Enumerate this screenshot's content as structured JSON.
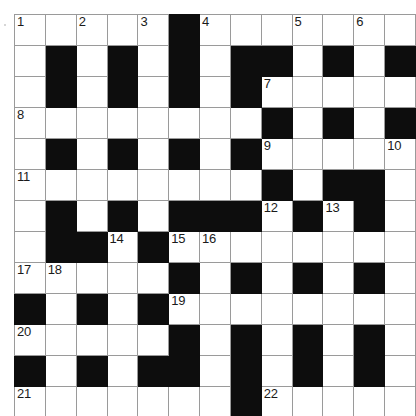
{
  "puzzle": {
    "type": "crossword-grid",
    "rows": 13,
    "columns": 13,
    "cell_size_px": 30,
    "colors": {
      "block": "#0d0d0d",
      "open": "#ffffff",
      "gridline": "#9a9a9a",
      "number_text": "#1a1a1a",
      "page_background": "#ffffff"
    },
    "grid": [
      [
        "O",
        "O",
        "O",
        "O",
        "O",
        "X",
        "O",
        "O",
        "O",
        "O",
        "O",
        "O",
        "O"
      ],
      [
        "O",
        "X",
        "O",
        "X",
        "O",
        "X",
        "O",
        "X",
        "X",
        "O",
        "X",
        "O",
        "X"
      ],
      [
        "O",
        "X",
        "O",
        "X",
        "O",
        "X",
        "O",
        "X",
        "O",
        "O",
        "O",
        "O",
        "O"
      ],
      [
        "O",
        "O",
        "O",
        "O",
        "O",
        "O",
        "O",
        "O",
        "X",
        "O",
        "X",
        "O",
        "X"
      ],
      [
        "O",
        "X",
        "O",
        "X",
        "O",
        "X",
        "O",
        "X",
        "O",
        "O",
        "O",
        "O",
        "O"
      ],
      [
        "O",
        "O",
        "O",
        "O",
        "O",
        "O",
        "O",
        "O",
        "X",
        "O",
        "X",
        "X",
        "O"
      ],
      [
        "O",
        "X",
        "O",
        "X",
        "O",
        "X",
        "X",
        "X",
        "O",
        "X",
        "O",
        "X",
        "O"
      ],
      [
        "O",
        "X",
        "X",
        "O",
        "X",
        "O",
        "O",
        "O",
        "O",
        "O",
        "O",
        "O",
        "O"
      ],
      [
        "O",
        "O",
        "O",
        "O",
        "O",
        "X",
        "O",
        "X",
        "O",
        "X",
        "O",
        "X",
        "O"
      ],
      [
        "X",
        "O",
        "X",
        "O",
        "X",
        "O",
        "O",
        "O",
        "O",
        "O",
        "O",
        "O",
        "O"
      ],
      [
        "O",
        "O",
        "O",
        "O",
        "O",
        "X",
        "O",
        "X",
        "O",
        "X",
        "O",
        "X",
        "O"
      ],
      [
        "X",
        "O",
        "X",
        "O",
        "X",
        "X",
        "O",
        "X",
        "O",
        "X",
        "O",
        "X",
        "O"
      ],
      [
        "O",
        "O",
        "O",
        "O",
        "O",
        "O",
        "O",
        "X",
        "O",
        "O",
        "O",
        "O",
        "O"
      ]
    ],
    "numbers": [
      {
        "number": "1",
        "row": 1,
        "col": 1
      },
      {
        "number": "2",
        "row": 1,
        "col": 3
      },
      {
        "number": "3",
        "row": 1,
        "col": 5
      },
      {
        "number": "4",
        "row": 1,
        "col": 7
      },
      {
        "number": "5",
        "row": 1,
        "col": 10
      },
      {
        "number": "6",
        "row": 1,
        "col": 12
      },
      {
        "number": "7",
        "row": 3,
        "col": 9
      },
      {
        "number": "8",
        "row": 4,
        "col": 1
      },
      {
        "number": "9",
        "row": 5,
        "col": 9
      },
      {
        "number": "10",
        "row": 5,
        "col": 13
      },
      {
        "number": "11",
        "row": 6,
        "col": 1
      },
      {
        "number": "12",
        "row": 7,
        "col": 9
      },
      {
        "number": "13",
        "row": 7,
        "col": 11
      },
      {
        "number": "14",
        "row": 8,
        "col": 4
      },
      {
        "number": "15",
        "row": 8,
        "col": 6
      },
      {
        "number": "16",
        "row": 8,
        "col": 7
      },
      {
        "number": "17",
        "row": 9,
        "col": 1
      },
      {
        "number": "18",
        "row": 9,
        "col": 2
      },
      {
        "number": "19",
        "row": 10,
        "col": 6
      },
      {
        "number": "20",
        "row": 11,
        "col": 1
      },
      {
        "number": "21",
        "row": 13,
        "col": 1
      },
      {
        "number": "22",
        "row": 13,
        "col": 9
      }
    ]
  }
}
